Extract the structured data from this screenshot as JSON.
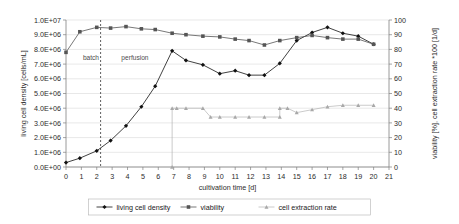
{
  "chart_data": {
    "type": "line",
    "title": "",
    "xlabel": "cultivation time [d]",
    "ylabel": "living cell density [cells/mL]",
    "ylabel_right": "viability [%], cell extraction rate *100 [1/d]",
    "xlim": [
      0,
      21
    ],
    "ylim": [
      0,
      10000000
    ],
    "ylim_right": [
      0,
      100
    ],
    "grid": true,
    "legend_position": "bottom",
    "xticks": [
      "0",
      "1",
      "2",
      "3",
      "4",
      "5",
      "6",
      "7",
      "8",
      "9",
      "10",
      "11",
      "12",
      "13",
      "14",
      "15",
      "16",
      "17",
      "18",
      "19",
      "20",
      "21"
    ],
    "yticks_left": [
      "0.0E+00",
      "1.0E+06",
      "2.0E+06",
      "3.0E+06",
      "4.0E+06",
      "5.0E+06",
      "6.0E+06",
      "7.0E+06",
      "8.0E+06",
      "9.0E+06",
      "1.0E+07"
    ],
    "yticks_right": [
      "0",
      "10",
      "20",
      "30",
      "40",
      "50",
      "60",
      "70",
      "80",
      "90",
      "100"
    ],
    "annotations": [
      {
        "text": "batch",
        "x": 1.1,
        "y": 7300000,
        "axis": "left"
      },
      {
        "text": "perfusion",
        "x": 3.6,
        "y": 7300000,
        "axis": "left"
      }
    ],
    "vertical_divider": {
      "x": 2.25,
      "style": "dashed"
    },
    "series": [
      {
        "name": "living cell density",
        "axis": "left",
        "marker": "diamond",
        "color": "#111111",
        "points": [
          [
            0.0,
            300000
          ],
          [
            0.9,
            600000
          ],
          [
            2.0,
            1100000
          ],
          [
            2.9,
            1800000
          ],
          [
            3.9,
            2800000
          ],
          [
            4.9,
            4100000
          ],
          [
            5.8,
            5500000
          ],
          [
            6.9,
            7900000
          ],
          [
            7.8,
            7250000
          ],
          [
            8.9,
            6950000
          ],
          [
            10.0,
            6350000
          ],
          [
            11.0,
            6550000
          ],
          [
            11.9,
            6250000
          ],
          [
            12.9,
            6250000
          ],
          [
            13.9,
            7050000
          ],
          [
            15.0,
            8600000
          ],
          [
            16.0,
            9150000
          ],
          [
            17.0,
            9500000
          ],
          [
            18.0,
            9100000
          ],
          [
            19.0,
            8900000
          ],
          [
            20.0,
            8350000
          ]
        ]
      },
      {
        "name": "viability",
        "axis": "right",
        "marker": "square",
        "color": "#555555",
        "points": [
          [
            0.0,
            78
          ],
          [
            0.9,
            92
          ],
          [
            2.0,
            95
          ],
          [
            2.9,
            94.5
          ],
          [
            3.9,
            95.5
          ],
          [
            4.9,
            94
          ],
          [
            5.8,
            93.5
          ],
          [
            6.9,
            91
          ],
          [
            7.8,
            90
          ],
          [
            8.9,
            89
          ],
          [
            10.0,
            88.5
          ],
          [
            11.0,
            87
          ],
          [
            11.9,
            86
          ],
          [
            12.9,
            83
          ],
          [
            13.9,
            86
          ],
          [
            15.0,
            88
          ],
          [
            16.0,
            89.5
          ],
          [
            17.0,
            88
          ],
          [
            18.0,
            87
          ],
          [
            19.0,
            87
          ],
          [
            20.0,
            83.5
          ]
        ]
      },
      {
        "name": "cell extraction rate",
        "axis": "right",
        "marker": "triangle",
        "color": "#a8a8a8",
        "points": [
          [
            6.9,
            0
          ],
          [
            6.9,
            40
          ],
          [
            7.2,
            40
          ],
          [
            7.8,
            40
          ],
          [
            8.9,
            40
          ],
          [
            9.4,
            34
          ],
          [
            10.0,
            34
          ],
          [
            11.0,
            34
          ],
          [
            11.9,
            34
          ],
          [
            12.9,
            34
          ],
          [
            13.9,
            34
          ],
          [
            13.9,
            40
          ],
          [
            14.4,
            40
          ],
          [
            15.0,
            37
          ],
          [
            16.0,
            39
          ],
          [
            17.0,
            41
          ],
          [
            18.0,
            42
          ],
          [
            19.0,
            42
          ],
          [
            20.0,
            42
          ]
        ]
      }
    ]
  },
  "legend": {
    "items": [
      {
        "label": "living cell density",
        "marker": "diamond",
        "color": "#111111"
      },
      {
        "label": "viability",
        "marker": "square",
        "color": "#555555"
      },
      {
        "label": "cell extraction rate",
        "marker": "triangle",
        "color": "#a8a8a8"
      }
    ]
  }
}
